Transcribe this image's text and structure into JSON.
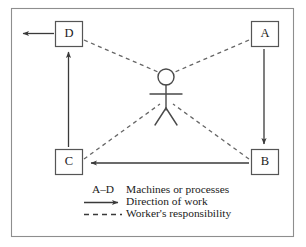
{
  "diagram": {
    "frame": {
      "stroke_color": "#8e8e8e"
    },
    "nodes": [
      {
        "id": "D",
        "label": "D",
        "x": 55,
        "y": 21,
        "w": 27,
        "h": 26
      },
      {
        "id": "A",
        "label": "A",
        "x": 251,
        "y": 21,
        "w": 27,
        "h": 26
      },
      {
        "id": "C",
        "label": "C",
        "x": 55,
        "y": 149,
        "w": 27,
        "h": 26
      },
      {
        "id": "B",
        "label": "B",
        "x": 251,
        "y": 149,
        "w": 27,
        "h": 26
      }
    ],
    "worker": {
      "name": "worker-stick-figure",
      "head_center_x": 166,
      "head_center_y": 77,
      "head_radius": 8
    },
    "flow_arrows": [
      {
        "name": "arrow-a-to-b",
        "from": "A",
        "to": "B",
        "direction": "down"
      },
      {
        "name": "arrow-b-to-c",
        "from": "B",
        "to": "C",
        "direction": "left"
      },
      {
        "name": "arrow-c-to-d",
        "from": "C",
        "to": "D",
        "direction": "up"
      },
      {
        "name": "arrow-d-to-out",
        "from": "D",
        "to": "output",
        "direction": "left"
      }
    ],
    "responsibility_links": [
      {
        "name": "link-worker-to-d",
        "from": "worker",
        "to": "D"
      },
      {
        "name": "link-worker-to-a",
        "from": "worker",
        "to": "A"
      },
      {
        "name": "link-worker-to-c",
        "from": "worker",
        "to": "C"
      },
      {
        "name": "link-worker-to-b",
        "from": "worker",
        "to": "B"
      }
    ],
    "colors": {
      "box_stroke": "#555555",
      "arrow": "#3a3a3a",
      "dashed": "#666666",
      "frame": "#8e8e8e",
      "text": "#1a1a1a"
    }
  },
  "legend": {
    "rows": [
      {
        "key": "A–D",
        "marker": "text",
        "label": "Machines or processes"
      },
      {
        "key": "",
        "marker": "solid-arrow",
        "label": "Direction of work"
      },
      {
        "key": "",
        "marker": "dashed-line",
        "label": "Worker's responsibility"
      }
    ]
  }
}
